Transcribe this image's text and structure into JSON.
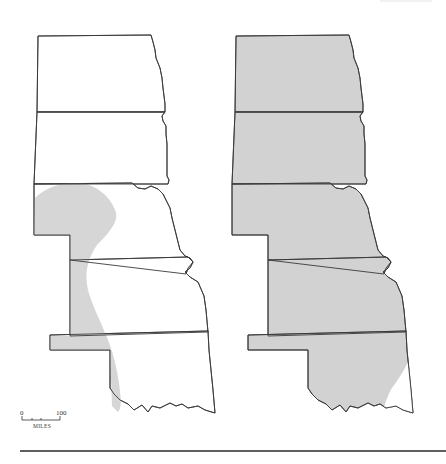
{
  "figure": {
    "type": "range-map-pair",
    "region": "Great Plains (North Dakota, South Dakota, Nebraska, Kansas, Oklahoma)",
    "panels": [
      {
        "id": "left",
        "description": "Shaded range limited to a western band running from southwestern South Dakota/Nebraska south through western Kansas into western Oklahoma",
        "fill_color": "#d6d6d6"
      },
      {
        "id": "right",
        "description": "Shaded range covering nearly the entire five-state region except southeastern Oklahoma",
        "fill_color": "#d2d2d2"
      }
    ],
    "states": [
      "North Dakota",
      "South Dakota",
      "Nebraska",
      "Kansas",
      "Oklahoma"
    ],
    "outline_color": "#3a3a3a"
  },
  "scale_bar": {
    "start_label": "0",
    "end_label": "100",
    "unit_label": "MILES"
  }
}
